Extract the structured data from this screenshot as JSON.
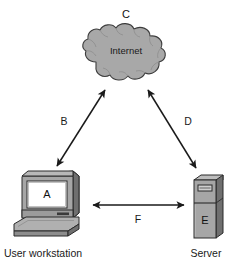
{
  "diagram": {
    "type": "network-topology",
    "background_color": "#ffffff",
    "nodes": [
      {
        "id": "workstation",
        "icon": "desktop-computer-icon",
        "letter": "A",
        "caption": "User workstation",
        "fill": "#a6a6a6",
        "screen_fill": "#ffffff",
        "outline": "#2b2b2b"
      },
      {
        "id": "internet-cloud",
        "icon": "cloud-icon",
        "letter": "C",
        "caption": "Internet",
        "fill": "#a8a8a8",
        "outline": "#3a3a3a"
      },
      {
        "id": "server",
        "icon": "server-tower-icon",
        "letter": "E",
        "caption": "Server",
        "fill": "#a6a6a6",
        "outline": "#2b2b2b"
      }
    ],
    "links": [
      {
        "id": "link-b",
        "letter": "B",
        "from": "workstation",
        "to": "internet-cloud",
        "arrow": "double",
        "color": "#1a1a1a"
      },
      {
        "id": "link-d",
        "letter": "D",
        "from": "internet-cloud",
        "to": "server",
        "arrow": "double",
        "color": "#1a1a1a"
      },
      {
        "id": "link-f",
        "letter": "F",
        "from": "workstation",
        "to": "server",
        "arrow": "double",
        "color": "#1a1a1a"
      }
    ],
    "labels": {
      "a": "A",
      "b": "B",
      "c": "C",
      "d": "D",
      "e": "E",
      "f": "F",
      "cloud_text": "Internet",
      "workstation_caption": "User workstation",
      "server_caption": "Server"
    }
  }
}
